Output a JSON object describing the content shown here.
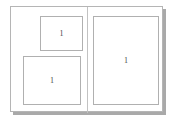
{
  "document": {
    "view_name": "page-spread-preview",
    "background_color": "#ffffff",
    "shadow_color": "#9a9a9a"
  },
  "spread": {
    "border_color": "#b5b5b5",
    "page_color": "#ffffff",
    "spine_color": "#c2c2c2",
    "pages": [
      {
        "side": "left",
        "name": "left-page",
        "frames": [
          {
            "id": "frame-a",
            "label": "1",
            "position": "upper-right"
          },
          {
            "id": "frame-b",
            "label": "1",
            "position": "lower-left"
          }
        ]
      },
      {
        "side": "right",
        "name": "right-page",
        "frames": [
          {
            "id": "frame-c",
            "label": "1",
            "position": "full"
          }
        ]
      }
    ]
  },
  "frames": {
    "border_color": "#b0b0b0",
    "fill_color": "#ffffff",
    "label_color": "#4a4a4a"
  }
}
